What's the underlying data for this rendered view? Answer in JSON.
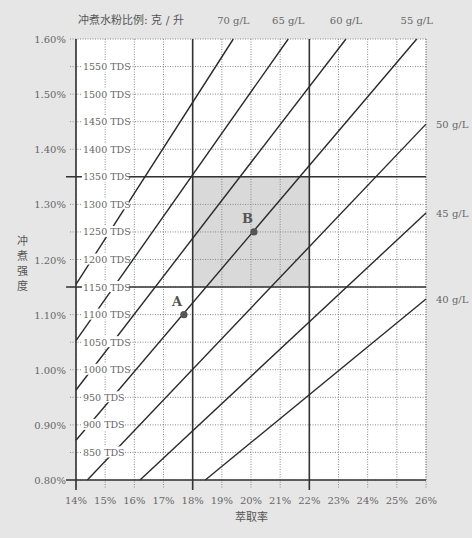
{
  "chart_data": {
    "type": "line",
    "title": "",
    "xlabel": "萃取率",
    "ylabel": "冲煮强度",
    "ratio_axis_title": "冲煮水粉比例: 克 / 升",
    "xlim": [
      14,
      26
    ],
    "ylim": [
      0.8,
      1.6
    ],
    "x_ticks": [
      14,
      15,
      16,
      17,
      18,
      19,
      20,
      21,
      22,
      23,
      24,
      25,
      26
    ],
    "x_tick_labels": [
      "14%",
      "15%",
      "16%",
      "17%",
      "18%",
      "19%",
      "20%",
      "21%",
      "22%",
      "23%",
      "24%",
      "25%",
      "26%"
    ],
    "y_ticks_pct": [
      0.8,
      0.9,
      1.0,
      1.1,
      1.2,
      1.3,
      1.4,
      1.5,
      1.6
    ],
    "y_tick_labels": [
      "0.80%",
      "0.90%",
      "1.00%",
      "1.10%",
      "1.20%",
      "1.30%",
      "1.40%",
      "1.50%",
      "1.60%"
    ],
    "tds_ticks": [
      {
        "value": 0.85,
        "label": "850 TDS"
      },
      {
        "value": 0.9,
        "label": "900 TDS"
      },
      {
        "value": 0.95,
        "label": "950 TDS"
      },
      {
        "value": 1.0,
        "label": "1000 TDS"
      },
      {
        "value": 1.05,
        "label": "1050 TDS"
      },
      {
        "value": 1.1,
        "label": "1100 TDS"
      },
      {
        "value": 1.15,
        "label": "1150 TDS"
      },
      {
        "value": 1.2,
        "label": "1200 TDS"
      },
      {
        "value": 1.25,
        "label": "1250 TDS"
      },
      {
        "value": 1.3,
        "label": "1300 TDS"
      },
      {
        "value": 1.35,
        "label": "1350 TDS"
      },
      {
        "value": 1.4,
        "label": "1400 TDS"
      },
      {
        "value": 1.45,
        "label": "1450 TDS"
      },
      {
        "value": 1.5,
        "label": "1500 TDS"
      },
      {
        "value": 1.55,
        "label": "1550 TDS"
      }
    ],
    "ideal_zone": {
      "ey": [
        18,
        22
      ],
      "tds": [
        1.15,
        1.35
      ]
    },
    "bold_vertical_ey": [
      14,
      18,
      22
    ],
    "bold_horizontal_tds": [
      0.8,
      1.15,
      1.35
    ],
    "series": [
      {
        "name": "70 g/L",
        "label": "70 g/L",
        "slope": 0.0825,
        "label_pos": "top"
      },
      {
        "name": "65 g/L",
        "label": "65 g/L",
        "slope": 0.0752,
        "label_pos": "top"
      },
      {
        "name": "60 g/L",
        "label": "60 g/L",
        "slope": 0.0688,
        "label_pos": "top"
      },
      {
        "name": "55 g/L",
        "label": "55 g/L",
        "slope": 0.0623,
        "label_pos": "top"
      },
      {
        "name": "50 g/L",
        "label": "50 g/L",
        "slope": 0.0556,
        "label_pos": "right"
      },
      {
        "name": "45 g/L",
        "label": "45 g/L",
        "slope": 0.0494,
        "label_pos": "right"
      },
      {
        "name": "40 g/L",
        "label": "40 g/L",
        "slope": 0.0434,
        "label_pos": "right"
      }
    ],
    "points": [
      {
        "label": "A",
        "ey": 17.7,
        "tds": 1.1
      },
      {
        "label": "B",
        "ey": 20.1,
        "tds": 1.25
      }
    ]
  },
  "colors": {
    "background": "#e6e6e6",
    "plot_bg": "#ffffff",
    "grid": "#888888",
    "bold": "#333333",
    "ratio_line": "#2a2a2a",
    "zone": "#d9d9d9",
    "point": "#555555"
  }
}
